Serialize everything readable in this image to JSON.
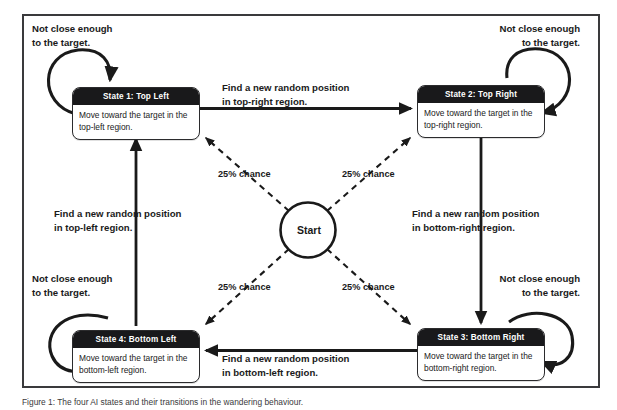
{
  "figure": {
    "caption": "Figure 1: The four AI states and their transitions in the wandering behaviour."
  },
  "start_node": {
    "label": "Start"
  },
  "states": [
    {
      "id": "state-1",
      "title": "State 1: Top Left",
      "body": "Move toward the target in the top-left region."
    },
    {
      "id": "state-2",
      "title": "State 2: Top Right",
      "body": "Move toward the target in the top-right region."
    },
    {
      "id": "state-3",
      "title": "State 3: Bottom Right",
      "body": "Move toward the target in the bottom-right region."
    },
    {
      "id": "state-4",
      "title": "State 4: Bottom Left",
      "body": "Move toward the target in the bottom-left region."
    }
  ],
  "self_loops": [
    {
      "for": "state-1",
      "label": "Not close enough\nto the target."
    },
    {
      "for": "state-2",
      "label": "Not close enough\nto the target."
    },
    {
      "for": "state-3",
      "label": "Not close enough\nto the target."
    },
    {
      "for": "state-4",
      "label": "Not close enough\nto the target."
    }
  ],
  "transitions": [
    {
      "from": "state-1",
      "to": "state-2",
      "label": "Find a new random position\nin top-right region."
    },
    {
      "from": "state-2",
      "to": "state-3",
      "label": "Find a new random position\nin bottom-right region."
    },
    {
      "from": "state-3",
      "to": "state-4",
      "label": "Find a new random position\nin bottom-left region."
    },
    {
      "from": "state-4",
      "to": "state-1",
      "label": "Find a new random position\nin top-left region."
    }
  ],
  "start_transitions": [
    {
      "to": "state-1",
      "label": "25% chance"
    },
    {
      "to": "state-2",
      "label": "25% chance"
    },
    {
      "to": "state-4",
      "label": "25% chance"
    },
    {
      "to": "state-3",
      "label": "25% chance"
    }
  ],
  "colors": {
    "frame_border": "#3a3a3c",
    "state_header_bg": "#19191b",
    "state_header_text": "#ffffff",
    "state_body_bg": "#ffffff",
    "edge_stroke": "#1a1a1a",
    "page_bg": "#ffffff"
  }
}
